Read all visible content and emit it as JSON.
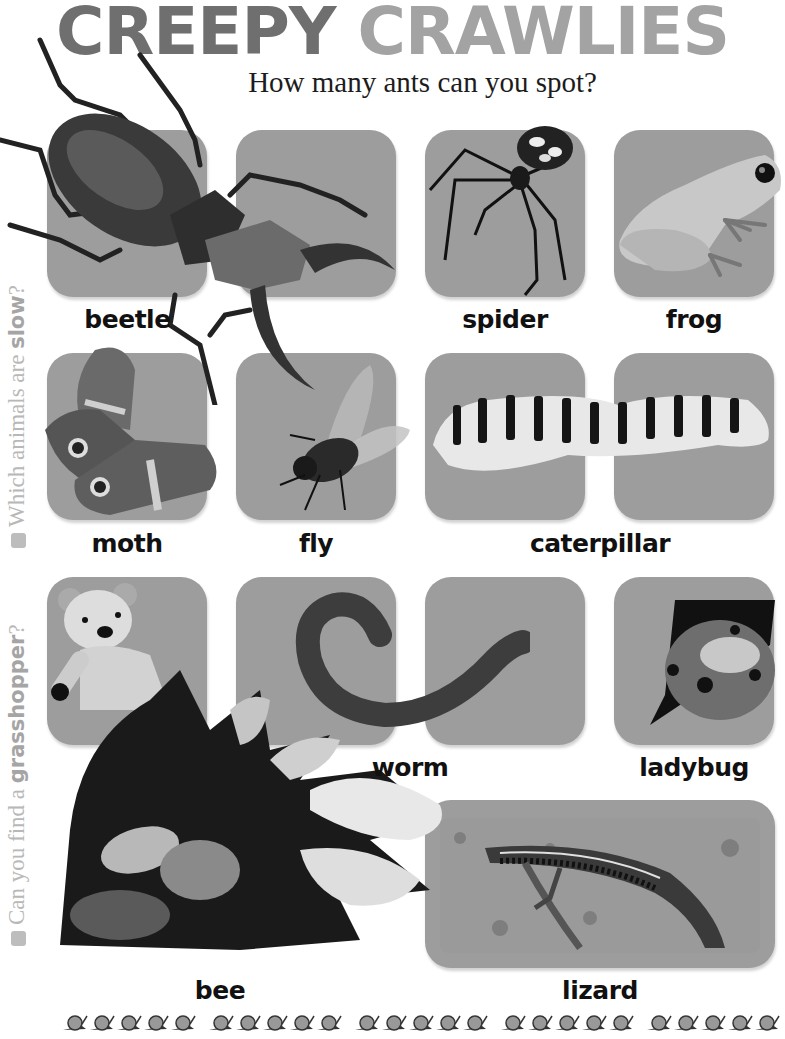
{
  "header": {
    "title_word1": "CREEPY",
    "title_word2": "CRAWLIES",
    "subtitle": "How many ants can you spot?"
  },
  "side_questions": [
    {
      "text_before": "Which animals are ",
      "bold": "slow",
      "text_after": "?"
    },
    {
      "text_before": "Can you find a ",
      "bold": "grasshopper",
      "text_after": "?"
    }
  ],
  "labels": {
    "beetle": "beetle",
    "spider": "spider",
    "frog": "frog",
    "moth": "moth",
    "fly": "fly",
    "caterpillar": "caterpillar",
    "worm": "worm",
    "ladybug": "ladybug",
    "bee": "bee",
    "lizard": "lizard"
  },
  "colors": {
    "tile_gray": "#9d9d9d",
    "title_dark": "#6f6f6f",
    "title_light": "#a3a3a3",
    "side_text": "#b8b8b8"
  },
  "footer": {
    "border_icon": "snail-icon",
    "groups": 5,
    "per_group": 5
  }
}
